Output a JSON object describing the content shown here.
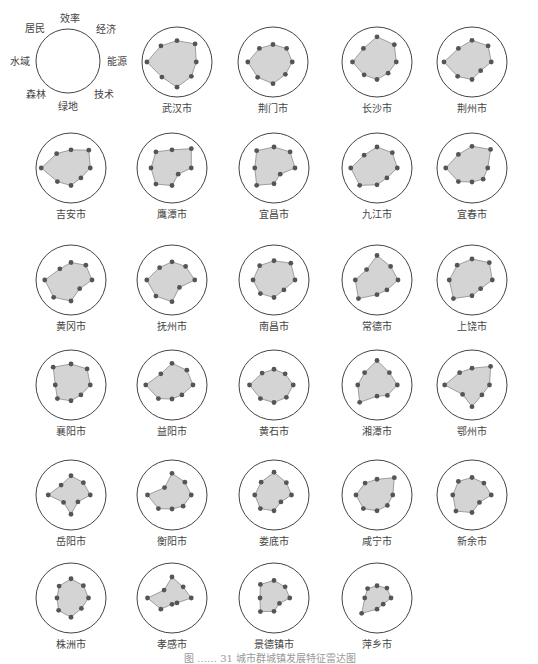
{
  "chart_data": {
    "type": "radar",
    "title": "",
    "axes": [
      "效率",
      "经济",
      "能源",
      "技术",
      "绿地",
      "森林",
      "水域",
      "居民"
    ],
    "legend": {
      "center": [
        68,
        61
      ],
      "radius": 32,
      "labels": [
        {
          "text": "效率",
          "x": 70,
          "y": 22
        },
        {
          "text": "经济",
          "x": 106,
          "y": 33
        },
        {
          "text": "能源",
          "x": 117,
          "y": 65
        },
        {
          "text": "技术",
          "x": 104,
          "y": 98
        },
        {
          "text": "绿地",
          "x": 68,
          "y": 110
        },
        {
          "text": "森林",
          "x": 36,
          "y": 98
        },
        {
          "text": "水域",
          "x": 20,
          "y": 65
        },
        {
          "text": "居民",
          "x": 35,
          "y": 32
        }
      ]
    },
    "style": {
      "circle_radius": 35,
      "fill": "#d4d4d4",
      "line": "#8a8a8a",
      "dot": "#555555",
      "circle_stroke": "#444444"
    },
    "cities": [
      {
        "name": "武汉市",
        "cx": 177,
        "cy": 62,
        "values": [
          0.61,
          0.73,
          0.55,
          0.58,
          0.72,
          0.61,
          0.86,
          0.65
        ]
      },
      {
        "name": "荆门市",
        "cx": 273,
        "cy": 62,
        "values": [
          0.5,
          0.55,
          0.55,
          0.5,
          0.62,
          0.62,
          0.72,
          0.55
        ]
      },
      {
        "name": "长沙市",
        "cx": 377,
        "cy": 62,
        "values": [
          0.72,
          0.7,
          0.55,
          0.45,
          0.5,
          0.52,
          0.7,
          0.55
        ]
      },
      {
        "name": "荆州市",
        "cx": 472,
        "cy": 62,
        "values": [
          0.62,
          0.65,
          0.55,
          0.35,
          0.5,
          0.58,
          0.8,
          0.55
        ]
      },
      {
        "name": "吉安市",
        "cx": 71,
        "cy": 168,
        "values": [
          0.52,
          0.72,
          0.55,
          0.4,
          0.5,
          0.55,
          0.85,
          0.58
        ]
      },
      {
        "name": "鹰潭市",
        "cx": 172,
        "cy": 168,
        "values": [
          0.52,
          0.78,
          0.55,
          0.25,
          0.5,
          0.65,
          0.6,
          0.65
        ]
      },
      {
        "name": "宜昌市",
        "cx": 274,
        "cy": 168,
        "values": [
          0.6,
          0.65,
          0.6,
          0.25,
          0.45,
          0.7,
          0.55,
          0.7
        ]
      },
      {
        "name": "九江市",
        "cx": 377,
        "cy": 168,
        "values": [
          0.6,
          0.62,
          0.58,
          0.4,
          0.48,
          0.7,
          0.75,
          0.52
        ]
      },
      {
        "name": "宜春市",
        "cx": 472,
        "cy": 168,
        "values": [
          0.62,
          0.75,
          0.45,
          0.45,
          0.4,
          0.55,
          0.75,
          0.55
        ]
      },
      {
        "name": "黄冈市",
        "cx": 71,
        "cy": 280,
        "values": [
          0.5,
          0.6,
          0.6,
          0.35,
          0.6,
          0.7,
          0.75,
          0.45
        ]
      },
      {
        "name": "抚州市",
        "cx": 172,
        "cy": 280,
        "values": [
          0.52,
          0.55,
          0.65,
          0.3,
          0.62,
          0.65,
          0.72,
          0.5
        ]
      },
      {
        "name": "南昌市",
        "cx": 274,
        "cy": 280,
        "values": [
          0.55,
          0.68,
          0.6,
          0.4,
          0.5,
          0.55,
          0.6,
          0.58
        ]
      },
      {
        "name": "常德市",
        "cx": 377,
        "cy": 280,
        "values": [
          0.7,
          0.55,
          0.6,
          0.4,
          0.42,
          0.75,
          0.62,
          0.42
        ]
      },
      {
        "name": "上饶市",
        "cx": 472,
        "cy": 280,
        "values": [
          0.6,
          0.7,
          0.58,
          0.35,
          0.45,
          0.75,
          0.65,
          0.6
        ]
      },
      {
        "name": "襄阳市",
        "cx": 71,
        "cy": 385,
        "values": [
          0.6,
          0.65,
          0.55,
          0.4,
          0.45,
          0.55,
          0.45,
          0.72
        ]
      },
      {
        "name": "益阳市",
        "cx": 172,
        "cy": 385,
        "values": [
          0.62,
          0.6,
          0.6,
          0.4,
          0.4,
          0.55,
          0.75,
          0.45
        ]
      },
      {
        "name": "黄石市",
        "cx": 274,
        "cy": 385,
        "values": [
          0.45,
          0.45,
          0.55,
          0.5,
          0.5,
          0.55,
          0.7,
          0.48
        ]
      },
      {
        "name": "湘潭市",
        "cx": 377,
        "cy": 385,
        "values": [
          0.7,
          0.5,
          0.58,
          0.42,
          0.32,
          0.7,
          0.55,
          0.5
        ]
      },
      {
        "name": "鄂州市",
        "cx": 472,
        "cy": 385,
        "values": [
          0.48,
          0.75,
          0.5,
          0.4,
          0.62,
          0.38,
          0.78,
          0.5
        ]
      },
      {
        "name": "岳阳市",
        "cx": 71,
        "cy": 495,
        "values": [
          0.55,
          0.5,
          0.55,
          0.28,
          0.55,
          0.3,
          0.65,
          0.4
        ]
      },
      {
        "name": "衡阳市",
        "cx": 172,
        "cy": 495,
        "values": [
          0.62,
          0.52,
          0.55,
          0.45,
          0.4,
          0.55,
          0.7,
          0.3
        ]
      },
      {
        "name": "娄底市",
        "cx": 274,
        "cy": 495,
        "values": [
          0.65,
          0.5,
          0.5,
          0.28,
          0.45,
          0.55,
          0.55,
          0.52
        ]
      },
      {
        "name": "咸宁市",
        "cx": 377,
        "cy": 495,
        "values": [
          0.45,
          0.7,
          0.45,
          0.42,
          0.45,
          0.55,
          0.6,
          0.48
        ]
      },
      {
        "name": "新余市",
        "cx": 472,
        "cy": 495,
        "values": [
          0.5,
          0.48,
          0.55,
          0.3,
          0.5,
          0.65,
          0.55,
          0.55
        ]
      },
      {
        "name": "株洲市",
        "cx": 71,
        "cy": 598,
        "values": [
          0.55,
          0.5,
          0.5,
          0.42,
          0.55,
          0.5,
          0.4,
          0.48
        ]
      },
      {
        "name": "孝感市",
        "cx": 172,
        "cy": 598,
        "values": [
          0.6,
          0.45,
          0.55,
          0.2,
          0.18,
          0.45,
          0.7,
          0.32
        ]
      },
      {
        "name": "景德镇市",
        "cx": 274,
        "cy": 598,
        "values": [
          0.5,
          0.45,
          0.45,
          0.22,
          0.38,
          0.55,
          0.4,
          0.55
        ]
      },
      {
        "name": "萍乡市",
        "cx": 377,
        "cy": 598,
        "values": [
          0.35,
          0.4,
          0.4,
          0.25,
          0.32,
          0.62,
          0.35,
          0.38
        ]
      }
    ]
  },
  "caption": {
    "text": "图 …… 31 城市群城镇发展特征雷达图",
    "x": 270,
    "y": 662
  }
}
